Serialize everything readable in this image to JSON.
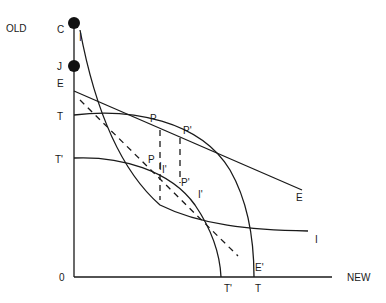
{
  "diagram": {
    "axes": {
      "y_label": "OLD",
      "x_label": "NEW",
      "origin_label": "0"
    },
    "points": {
      "c": "C",
      "j": "J"
    },
    "curve_labels": {
      "e_top": "E",
      "e_right": "E",
      "e_prime": "E'",
      "t_left": "T",
      "t_bottom": "T",
      "t_prime_left": "T'",
      "t_prime_bottom": "T'",
      "i_top": "I",
      "i_right": "I",
      "i_prime_mid": "I'",
      "i_prime_right": "I'",
      "i_inner": "I",
      "p_upper": "P",
      "p_prime_upper": "P'",
      "p_lower": "P",
      "p_prime_lower": "P'"
    }
  }
}
